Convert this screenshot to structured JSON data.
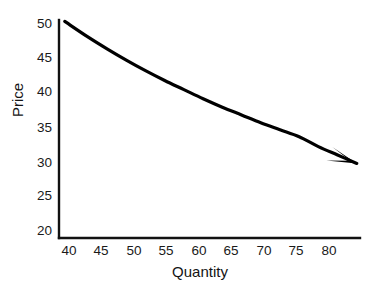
{
  "chart_data": {
    "type": "line",
    "title": "",
    "subtitle": "",
    "xlabel": "Quantity",
    "ylabel": "Price",
    "xlim": [
      37.5,
      84.5
    ],
    "ylim": [
      20,
      51
    ],
    "grid": false,
    "legend": null,
    "xticks": [
      40,
      45,
      50,
      55,
      60,
      65,
      70,
      75,
      80
    ],
    "xtick_labels": [
      "40",
      "45",
      "50",
      "55",
      "60",
      "65",
      "70",
      "75",
      "80"
    ],
    "yticks": [
      20,
      25,
      30,
      35,
      40,
      45,
      50
    ],
    "ytick_labels": [
      "20",
      "25",
      "30",
      "35",
      "40",
      "45",
      "50"
    ],
    "annotations": [
      "arrow-head at right end of curve"
    ],
    "series": [
      {
        "name": "Demand curve",
        "style": "solid",
        "color": "#000000",
        "line_width": 3,
        "arrow_end": true,
        "x": [
          38.4,
          42,
          45,
          48,
          51,
          54,
          57,
          60,
          63,
          66,
          69,
          72,
          75,
          78,
          81,
          84
        ],
        "y": [
          50.8,
          48.6,
          46.9,
          45.3,
          43.8,
          42.4,
          41.1,
          39.8,
          38.6,
          37.5,
          36.4,
          35.4,
          34.4,
          33.0,
          31.8,
          30.6
        ]
      }
    ]
  },
  "axes": {
    "spine_color": "#111111",
    "background": "#ffffff"
  }
}
